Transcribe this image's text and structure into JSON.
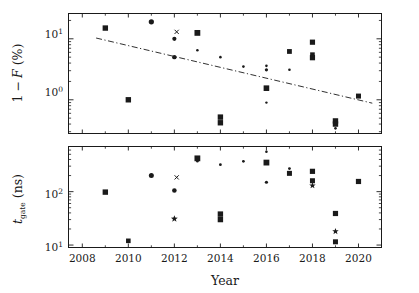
{
  "figure": {
    "width": 419,
    "height": 293,
    "background": "#ffffff",
    "foreground": "#1a1a1a"
  },
  "chart_data": [
    {
      "id": "panel-top",
      "type": "scatter",
      "title": "",
      "xlabel": "",
      "ylabel": "1 − F (%)",
      "xscale": "linear",
      "yscale": "log",
      "xlim": [
        2007.4,
        2021.0
      ],
      "ylim": [
        0.28,
        26.0
      ],
      "xticks": [
        2008,
        2010,
        2012,
        2014,
        2016,
        2018,
        2020
      ],
      "xticklabels": [
        "2008",
        "2010",
        "2012",
        "2014",
        "2016",
        "2018",
        "2020"
      ],
      "yticks": [
        1,
        10
      ],
      "yticklabels": [
        "10⁰",
        "10¹"
      ],
      "grid": false,
      "legend": null,
      "points": [
        {
          "x": 2009,
          "y": 15.0,
          "marker": "square",
          "size": 5.4
        },
        {
          "x": 2010,
          "y": 1.0,
          "marker": "square",
          "size": 5.4
        },
        {
          "x": 2011,
          "y": 19.0,
          "marker": "circle",
          "size": 5.2
        },
        {
          "x": 2012,
          "y": 10.0,
          "marker": "circle",
          "size": 4.2
        },
        {
          "x": 2012,
          "y": 5.0,
          "marker": "circle",
          "size": 4.4
        },
        {
          "x": 2012.1,
          "y": 13.0,
          "marker": "x",
          "size": 4.2
        },
        {
          "x": 2013,
          "y": 12.5,
          "marker": "square",
          "size": 5.8
        },
        {
          "x": 2013,
          "y": 6.5,
          "marker": "dot",
          "size": 2.6
        },
        {
          "x": 2014,
          "y": 5.0,
          "marker": "dot",
          "size": 2.6
        },
        {
          "x": 2014,
          "y": 0.52,
          "marker": "square",
          "size": 5.4
        },
        {
          "x": 2014,
          "y": 0.42,
          "marker": "square",
          "size": 5.4
        },
        {
          "x": 2015,
          "y": 3.5,
          "marker": "dot",
          "size": 2.6
        },
        {
          "x": 2016,
          "y": 3.6,
          "marker": "dot",
          "size": 2.6
        },
        {
          "x": 2016,
          "y": 3.1,
          "marker": "dot",
          "size": 3.2
        },
        {
          "x": 2016,
          "y": 1.55,
          "marker": "square",
          "size": 5.6
        },
        {
          "x": 2016,
          "y": 0.9,
          "marker": "dot",
          "size": 2.4
        },
        {
          "x": 2017,
          "y": 6.2,
          "marker": "square",
          "size": 4.8
        },
        {
          "x": 2017,
          "y": 3.1,
          "marker": "dot",
          "size": 2.6
        },
        {
          "x": 2018,
          "y": 8.8,
          "marker": "square",
          "size": 5.2
        },
        {
          "x": 2018,
          "y": 5.5,
          "marker": "square",
          "size": 4.6
        },
        {
          "x": 2018,
          "y": 4.9,
          "marker": "square",
          "size": 5.2
        },
        {
          "x": 2019,
          "y": 0.45,
          "marker": "square",
          "size": 5.4
        },
        {
          "x": 2019,
          "y": 0.4,
          "marker": "square",
          "size": 5.4
        },
        {
          "x": 2019,
          "y": 0.34,
          "marker": "dot",
          "size": 2.6
        },
        {
          "x": 2020,
          "y": 1.15,
          "marker": "square",
          "size": 5.0
        }
      ],
      "trendline": {
        "style": "dash-dot",
        "x0": 2008.6,
        "y0": 10.3,
        "x1": 2020.6,
        "y1": 0.88
      }
    },
    {
      "id": "panel-bottom",
      "type": "scatter",
      "title": "",
      "xlabel": "Year",
      "ylabel": "t_gate (ns)",
      "xscale": "linear",
      "yscale": "log",
      "xlim": [
        2007.4,
        2021.0
      ],
      "ylim": [
        9.0,
        700.0
      ],
      "xticks": [
        2008,
        2010,
        2012,
        2014,
        2016,
        2018,
        2020
      ],
      "xticklabels": [
        "2008",
        "2010",
        "2012",
        "2014",
        "2016",
        "2018",
        "2020"
      ],
      "yticks": [
        10,
        100
      ],
      "yticklabels": [
        "10¹",
        "10²"
      ],
      "grid": false,
      "legend": null,
      "points": [
        {
          "x": 2009,
          "y": 98,
          "marker": "square",
          "size": 5.4
        },
        {
          "x": 2010,
          "y": 12,
          "marker": "square",
          "size": 4.6
        },
        {
          "x": 2011,
          "y": 200,
          "marker": "circle",
          "size": 5.0
        },
        {
          "x": 2012,
          "y": 105,
          "marker": "circle",
          "size": 4.6
        },
        {
          "x": 2012.1,
          "y": 185,
          "marker": "x",
          "size": 4.2
        },
        {
          "x": 2012,
          "y": 31,
          "marker": "star",
          "size": 3.6
        },
        {
          "x": 2013,
          "y": 420,
          "marker": "square",
          "size": 5.8
        },
        {
          "x": 2013,
          "y": 370,
          "marker": "dot",
          "size": 2.6
        },
        {
          "x": 2014,
          "y": 320,
          "marker": "dot",
          "size": 2.8
        },
        {
          "x": 2014,
          "y": 38,
          "marker": "square",
          "size": 5.4
        },
        {
          "x": 2014,
          "y": 30,
          "marker": "square",
          "size": 5.4
        },
        {
          "x": 2015,
          "y": 370,
          "marker": "dot",
          "size": 2.8
        },
        {
          "x": 2016,
          "y": 560,
          "marker": "dot",
          "size": 2.6
        },
        {
          "x": 2016,
          "y": 350,
          "marker": "square",
          "size": 5.8
        },
        {
          "x": 2016,
          "y": 150,
          "marker": "dot",
          "size": 3.2
        },
        {
          "x": 2017,
          "y": 270,
          "marker": "dot",
          "size": 2.8
        },
        {
          "x": 2017,
          "y": 220,
          "marker": "square",
          "size": 5.0
        },
        {
          "x": 2018,
          "y": 240,
          "marker": "square",
          "size": 5.2
        },
        {
          "x": 2018,
          "y": 160,
          "marker": "square",
          "size": 5.0
        },
        {
          "x": 2018,
          "y": 130,
          "marker": "star",
          "size": 3.4
        },
        {
          "x": 2019,
          "y": 39,
          "marker": "square",
          "size": 5.2
        },
        {
          "x": 2019,
          "y": 18,
          "marker": "star",
          "size": 3.4
        },
        {
          "x": 2019,
          "y": 11.5,
          "marker": "square",
          "size": 5.0
        },
        {
          "x": 2020,
          "y": 155,
          "marker": "square",
          "size": 5.2
        }
      ],
      "trendline": null
    }
  ],
  "labels": {
    "ylabel_top_part1": "1",
    "ylabel_top_minus": "−",
    "ylabel_top_part2": "F",
    "ylabel_top_units": "(%)",
    "ylabel_bottom_main": "t",
    "ylabel_bottom_sub": "gate",
    "ylabel_bottom_units": "(ns)",
    "xlabel": "Year",
    "ytick_top_1": "10",
    "ytick_top_1_exp": "1",
    "ytick_top_0": "10",
    "ytick_top_0_exp": "0",
    "ytick_bot_2": "10",
    "ytick_bot_2_exp": "2",
    "ytick_bot_1": "10",
    "ytick_bot_1_exp": "1"
  }
}
